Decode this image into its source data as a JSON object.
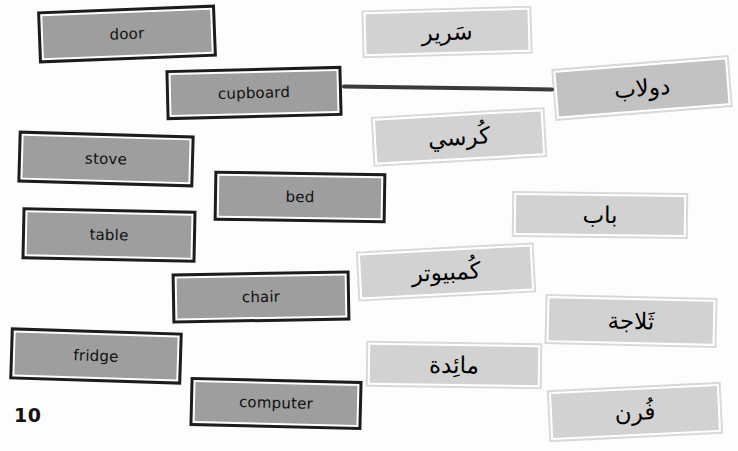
{
  "page": {
    "number": "10",
    "width": 738,
    "height": 451,
    "background": "#fdfdfd"
  },
  "colors": {
    "english_card_fill": "#9e9e9e",
    "english_card_border": "#1c1c1c",
    "arabic_card_fill": "#d2d2d2",
    "arabic_card_fill_dark": "#c2c2c2",
    "arabic_card_border": "#d9d9d9",
    "connector_line": "#3a3a3a",
    "text": "#111111"
  },
  "english_cards": [
    {
      "id": "door",
      "label": "door",
      "x": 38,
      "y": 8,
      "w": 178,
      "h": 52,
      "rotate": -2.2
    },
    {
      "id": "cupboard",
      "label": "cupboard",
      "x": 166,
      "y": 68,
      "w": 176,
      "h": 50,
      "rotate": -1.4
    },
    {
      "id": "stove",
      "label": "stove",
      "x": 18,
      "y": 133,
      "w": 176,
      "h": 52,
      "rotate": 1.6
    },
    {
      "id": "bed",
      "label": "bed",
      "x": 214,
      "y": 172,
      "w": 172,
      "h": 50,
      "rotate": 0.9
    },
    {
      "id": "table",
      "label": "table",
      "x": 22,
      "y": 209,
      "w": 174,
      "h": 52,
      "rotate": 1.2
    },
    {
      "id": "chair",
      "label": "chair",
      "x": 172,
      "y": 272,
      "w": 178,
      "h": 50,
      "rotate": -1.0
    },
    {
      "id": "fridge",
      "label": "fridge",
      "x": 10,
      "y": 330,
      "w": 172,
      "h": 52,
      "rotate": 1.8
    },
    {
      "id": "computer",
      "label": "computer",
      "x": 190,
      "y": 379,
      "w": 172,
      "h": 49,
      "rotate": 1.4
    }
  ],
  "arabic_cards": [
    {
      "id": "sareer",
      "label": "سَرير",
      "english": "bed",
      "x": 362,
      "y": 8,
      "w": 170,
      "h": 48,
      "rotate": -1.6,
      "dark": false
    },
    {
      "id": "doolab",
      "label": "دولاب",
      "english": "cupboard",
      "x": 553,
      "y": 62,
      "w": 178,
      "h": 52,
      "rotate": -4.5,
      "dark": true
    },
    {
      "id": "kursi",
      "label": "كُرسي",
      "english": "chair",
      "x": 372,
      "y": 112,
      "w": 174,
      "h": 50,
      "rotate": -3.2,
      "dark": false
    },
    {
      "id": "bab",
      "label": "باب",
      "english": "door",
      "x": 512,
      "y": 192,
      "w": 176,
      "h": 46,
      "rotate": 0.6,
      "dark": false
    },
    {
      "id": "kombuter",
      "label": "كُمبيوتر",
      "english": "computer",
      "x": 357,
      "y": 247,
      "w": 178,
      "h": 50,
      "rotate": -3.0,
      "dark": false
    },
    {
      "id": "thallaja",
      "label": "ثَلاجة",
      "english": "fridge",
      "x": 545,
      "y": 296,
      "w": 172,
      "h": 50,
      "rotate": 1.3,
      "dark": false
    },
    {
      "id": "maaida",
      "label": "مائِدة",
      "english": "table",
      "x": 366,
      "y": 342,
      "w": 176,
      "h": 46,
      "rotate": 0.8,
      "dark": false
    },
    {
      "id": "furn",
      "label": "فُرن",
      "english": "stove",
      "x": 548,
      "y": 386,
      "w": 174,
      "h": 52,
      "rotate": -2.8,
      "dark": false
    }
  ],
  "connector": {
    "from": "cupboard",
    "to": "doolab",
    "x": 342,
    "y": 86,
    "w": 212,
    "h": 4,
    "rotate": 0.8
  }
}
